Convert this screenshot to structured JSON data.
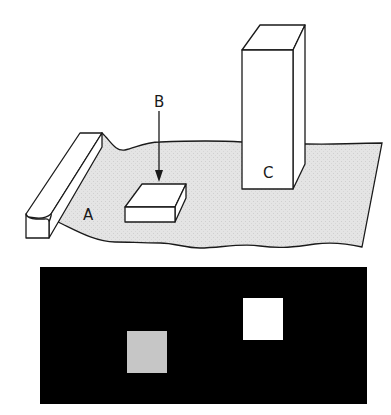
{
  "scene": {
    "labels": {
      "a": "A",
      "b": "B",
      "c": "C"
    },
    "colors": {
      "sheet_fill": "#e4e4e4",
      "stroke": "#1a1a1a",
      "object_fill": "#ffffff"
    }
  },
  "image_panel": {
    "background": "#000000",
    "squares": [
      {
        "name": "gray-square",
        "color": "#c6c6c6"
      },
      {
        "name": "white-square",
        "color": "#ffffff"
      }
    ]
  }
}
